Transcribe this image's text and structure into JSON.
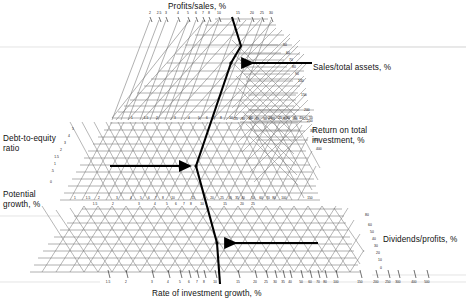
{
  "figure": {
    "type": "nomogram"
  },
  "labels": {
    "profits_sales": "Profits/sales, %",
    "sales_total_assets": "Sales/total assets, %",
    "return_on_investment": "Return on total\ninvestment, %",
    "debt_to_equity": "Debt-to-equity\nratio",
    "potential_growth": "Potential\ngrowth, %",
    "dividends_profits": "Dividends/profits, %",
    "rate_of_investment_growth": "Rate of investment growth, %"
  },
  "chart_data": {
    "type": "line",
    "xlabel": "Rate of investment growth, %",
    "ylabel": "",
    "grid": true,
    "legend": "none",
    "axes": [
      {
        "name": "profits_sales",
        "label": "Profits/sales, %",
        "position": "top",
        "orientation": "diagonal-up-right",
        "ticks": [
          "2",
          "2.5",
          "3",
          "4",
          "5",
          "6",
          "7",
          "8",
          "10",
          "15",
          "20",
          "25",
          "30"
        ],
        "values": [
          2,
          2.5,
          3,
          4,
          5,
          6,
          7,
          8,
          10,
          15,
          20,
          25,
          30
        ],
        "scale": "log"
      },
      {
        "name": "sales_total_assets",
        "label": "Sales/total assets, %",
        "position": "right-upper",
        "orientation": "vertical",
        "ticks": [
          "50",
          "60",
          "70",
          "80",
          "90",
          "100",
          "150",
          "200",
          "250",
          "300",
          "350",
          "400"
        ],
        "values": [
          50,
          60,
          70,
          80,
          90,
          100,
          150,
          200,
          250,
          300,
          350,
          400
        ],
        "scale": "log"
      },
      {
        "name": "return_on_investment",
        "label": "Return on total investment, %",
        "position": "right-middle-diagonal",
        "orientation": "diagonal",
        "ticks": [
          "25",
          "30",
          "35",
          "40",
          "50",
          "60",
          "80",
          "100",
          "120"
        ],
        "values": [
          25,
          30,
          35,
          40,
          50,
          60,
          80,
          100,
          120
        ],
        "scale": "log"
      },
      {
        "name": "debt_to_equity",
        "label": "Debt-to-equity ratio",
        "position": "left-upper",
        "orientation": "vertical",
        "ticks": [
          "5",
          "4",
          "3",
          "2",
          "1.5",
          "1",
          ".5",
          "0"
        ],
        "values": [
          5,
          4,
          3,
          2,
          1.5,
          1,
          0.5,
          0
        ],
        "scale": "linear-desc"
      },
      {
        "name": "potential_growth",
        "label": "Potential growth, %",
        "position": "middle-horizontal",
        "orientation": "horizontal",
        "ticks": [
          "1",
          "1.5",
          "2",
          "3",
          "4",
          "5",
          "6",
          "7",
          "8",
          "10",
          "15",
          "20",
          "25",
          "30",
          "35",
          "40",
          "50",
          "60",
          "70",
          "80",
          "100",
          "150"
        ],
        "values": [
          1,
          1.5,
          2,
          3,
          4,
          5,
          6,
          7,
          8,
          10,
          15,
          20,
          25,
          30,
          35,
          40,
          50,
          60,
          70,
          80,
          100,
          150
        ],
        "scale": "log"
      },
      {
        "name": "dividends_profits",
        "label": "Dividends/profits, %",
        "position": "right-lower",
        "orientation": "vertical",
        "ticks": [
          "80",
          "60",
          "50",
          "40",
          "30",
          "20",
          "10",
          "0"
        ],
        "values": [
          80,
          60,
          50,
          40,
          30,
          20,
          10,
          0
        ],
        "scale": "linear-desc"
      },
      {
        "name": "rate_of_investment_growth",
        "label": "Rate of investment growth, %",
        "position": "bottom",
        "orientation": "horizontal",
        "ticks": [
          "1.5",
          "2",
          "3",
          "4",
          "5",
          "6",
          "7",
          "8",
          "10",
          "15",
          "20",
          "25",
          "30",
          "35",
          "40",
          "50",
          "60",
          "70",
          "80",
          "100",
          "150",
          "200",
          "250",
          "300",
          "400",
          "500"
        ],
        "values": [
          1.5,
          2,
          3,
          4,
          5,
          6,
          7,
          8,
          10,
          15,
          20,
          25,
          30,
          35,
          40,
          50,
          60,
          70,
          80,
          100,
          150,
          200,
          250,
          300,
          400,
          500
        ],
        "scale": "log"
      }
    ],
    "solution_path": {
      "style": "bold-black-with-arrowheads",
      "description": "Worked-example trace running from the upper Profits/sales scale down through the central junctions to the lower Dividends/profits scale",
      "vertices": [
        [
          233,
          18
        ],
        [
          240,
          45
        ],
        [
          231,
          63
        ],
        [
          196,
          167
        ],
        [
          216,
          243
        ],
        [
          219,
          282
        ]
      ],
      "arrows": [
        {
          "at": [
            236,
            62
          ],
          "direction": "left",
          "from": "sales/total assets"
        },
        {
          "at": [
            168,
            166
          ],
          "direction": "right",
          "from": "debt-to-equity"
        },
        {
          "at": [
            289,
            242
          ],
          "direction": "left",
          "from": "dividends/profits"
        }
      ]
    },
    "ylim": [
      0,
      0
    ],
    "xlim": [
      0,
      0
    ]
  },
  "colors": {
    "grid": "#6d6d6d",
    "grid_light": "#9a9a9a",
    "path": "#000000",
    "text": "#111111",
    "background": "#ffffff"
  }
}
